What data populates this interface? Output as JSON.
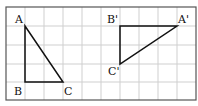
{
  "diagram": {
    "type": "grid-triangles-rotation",
    "grid": {
      "columns": 10,
      "rows": 5,
      "cell_px": 19,
      "origin": [
        6,
        7
      ],
      "line_color": "#c8c8c8",
      "border_color": "#555555"
    },
    "triangles": [
      {
        "name": "ABC",
        "vertices": [
          {
            "label": "A",
            "cell": [
              1,
              1
            ]
          },
          {
            "label": "B",
            "cell": [
              1,
              4
            ]
          },
          {
            "label": "C",
            "cell": [
              3,
              4
            ]
          }
        ]
      },
      {
        "name": "A'B'C'",
        "vertices": [
          {
            "label": "A'",
            "cell": [
              9,
              1
            ]
          },
          {
            "label": "B'",
            "cell": [
              6,
              1
            ]
          },
          {
            "label": "C'",
            "cell": [
              6,
              3
            ]
          }
        ]
      }
    ],
    "labels": {
      "A": "A",
      "B": "B",
      "C": "C",
      "A_prime": "A'",
      "B_prime": "B'",
      "C_prime": "C'"
    }
  }
}
